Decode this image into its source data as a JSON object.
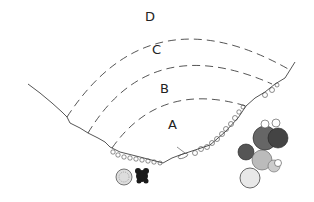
{
  "diagram": {
    "type": "cove-zonation-sketch",
    "zones": [
      {
        "id": "A",
        "label": "A",
        "x": 168,
        "y": 118
      },
      {
        "id": "B",
        "label": "B",
        "x": 160,
        "y": 82
      },
      {
        "id": "C",
        "label": "C",
        "x": 152,
        "y": 43
      },
      {
        "id": "D",
        "label": "D",
        "x": 145,
        "y": 10
      }
    ],
    "colors": {
      "line": "#2a2a2a",
      "background": "#ffffff",
      "shrub_dark": "#1a1a1a",
      "shrub_light": "#777777"
    }
  }
}
